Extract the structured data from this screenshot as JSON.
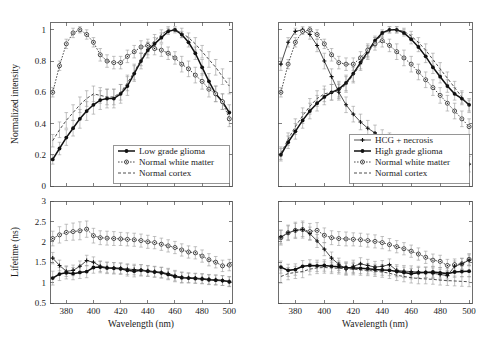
{
  "figure": {
    "title": "",
    "panel_count": 4
  },
  "axes": {
    "wavelength_label": "Wavelength (nm)",
    "intensity_label": "Normalized intensity",
    "lifetime_label": "Lifetime (ns)",
    "wavelength_ticks": [
      "380",
      "400",
      "420",
      "440",
      "460",
      "480",
      "500"
    ],
    "intensity_ticks": [
      "0",
      "0.2",
      "0.4",
      "0.6",
      "0.8",
      "1"
    ],
    "lifetime_ticks": [
      "0.5",
      "1",
      "1.5",
      "2",
      "2.5",
      "3"
    ]
  },
  "legends": {
    "top_left": [
      {
        "label": "Low grade glioma",
        "style": "solid-star"
      },
      {
        "label": "Normal white matter",
        "style": "dotted-circle"
      },
      {
        "label": "Normal cortex",
        "style": "dashed"
      }
    ],
    "top_right": [
      {
        "label": "HCG + necrosis",
        "style": "thin-plus"
      },
      {
        "label": "High grade glioma",
        "style": "solid-star"
      },
      {
        "label": "Normal white matter",
        "style": "dotted-circle"
      },
      {
        "label": "Normal cortex",
        "style": "dashed"
      }
    ]
  },
  "chart_data": [
    {
      "id": "panel-a-intensity-low-grade",
      "type": "line",
      "title": "",
      "xlabel": "",
      "ylabel": "Normalized intensity",
      "xlim": [
        368,
        502
      ],
      "ylim": [
        0,
        1.05
      ],
      "grid": false,
      "legend_position": "bottom-right",
      "x": [
        370,
        375,
        380,
        385,
        390,
        395,
        400,
        405,
        410,
        415,
        420,
        425,
        430,
        435,
        440,
        445,
        450,
        455,
        460,
        465,
        470,
        475,
        480,
        485,
        490,
        495,
        500
      ],
      "series": [
        {
          "name": "Low grade glioma",
          "style": "solid-star",
          "values": [
            0.17,
            0.24,
            0.31,
            0.37,
            0.43,
            0.48,
            0.52,
            0.55,
            0.56,
            0.56,
            0.59,
            0.64,
            0.72,
            0.8,
            0.87,
            0.91,
            0.95,
            0.99,
            1.0,
            0.97,
            0.92,
            0.85,
            0.76,
            0.67,
            0.59,
            0.54,
            0.47
          ],
          "errors": [
            0.03,
            0.04,
            0.05,
            0.05,
            0.06,
            0.06,
            0.06,
            0.06,
            0.06,
            0.06,
            0.06,
            0.06,
            0.05,
            0.05,
            0.05,
            0.04,
            0.03,
            0.02,
            0.01,
            0.02,
            0.03,
            0.04,
            0.05,
            0.05,
            0.05,
            0.05,
            0.05
          ]
        },
        {
          "name": "Normal white matter",
          "style": "dotted-circle",
          "values": [
            0.6,
            0.77,
            0.91,
            0.98,
            1.0,
            0.97,
            0.92,
            0.84,
            0.8,
            0.79,
            0.79,
            0.83,
            0.86,
            0.89,
            0.9,
            0.88,
            0.87,
            0.85,
            0.82,
            0.78,
            0.75,
            0.71,
            0.67,
            0.62,
            0.59,
            0.54,
            0.43
          ],
          "errors": [
            0.03,
            0.03,
            0.03,
            0.03,
            0.02,
            0.03,
            0.03,
            0.04,
            0.04,
            0.04,
            0.04,
            0.04,
            0.04,
            0.04,
            0.04,
            0.04,
            0.04,
            0.04,
            0.04,
            0.05,
            0.05,
            0.05,
            0.05,
            0.05,
            0.05,
            0.05,
            0.05
          ]
        },
        {
          "name": "Normal cortex",
          "style": "dashed",
          "values": [
            0.29,
            0.36,
            0.42,
            0.47,
            0.52,
            0.56,
            0.59,
            0.58,
            0.57,
            0.57,
            0.6,
            0.66,
            0.73,
            0.81,
            0.88,
            0.93,
            0.97,
            1.0,
            1.0,
            0.98,
            0.95,
            0.91,
            0.86,
            0.81,
            0.76,
            0.7,
            0.64
          ],
          "errors": [
            0.04,
            0.05,
            0.05,
            0.05,
            0.05,
            0.05,
            0.05,
            0.05,
            0.05,
            0.05,
            0.05,
            0.05,
            0.05,
            0.04,
            0.04,
            0.04,
            0.03,
            0.02,
            0.02,
            0.03,
            0.03,
            0.04,
            0.04,
            0.05,
            0.05,
            0.05,
            0.05
          ]
        }
      ]
    },
    {
      "id": "panel-b-intensity-high-grade",
      "type": "line",
      "title": "",
      "xlabel": "",
      "ylabel": "",
      "xlim": [
        368,
        502
      ],
      "ylim": [
        0,
        1.05
      ],
      "grid": false,
      "legend_position": "bottom-right",
      "x": [
        370,
        375,
        380,
        385,
        390,
        395,
        400,
        405,
        410,
        415,
        420,
        425,
        430,
        435,
        440,
        445,
        450,
        455,
        460,
        465,
        470,
        475,
        480,
        485,
        490,
        495,
        500
      ],
      "series": [
        {
          "name": "HCG + necrosis",
          "style": "thin-plus",
          "values": [
            0.78,
            0.92,
            0.99,
            1.0,
            0.97,
            0.9,
            0.8,
            0.7,
            0.6,
            0.52,
            0.46,
            0.41,
            0.37,
            0.34,
            0.31,
            0.29,
            0.27,
            0.25,
            0.23,
            0.21,
            0.2,
            0.19,
            0.18,
            0.17,
            0.16,
            0.15,
            0.14
          ],
          "errors": [
            0.04,
            0.03,
            0.02,
            0.02,
            0.03,
            0.04,
            0.05,
            0.05,
            0.05,
            0.05,
            0.05,
            0.05,
            0.05,
            0.05,
            0.05,
            0.05,
            0.05,
            0.05,
            0.05,
            0.05,
            0.05,
            0.05,
            0.05,
            0.05,
            0.05,
            0.05,
            0.05
          ]
        },
        {
          "name": "High grade glioma",
          "style": "solid-star",
          "values": [
            0.2,
            0.28,
            0.35,
            0.42,
            0.48,
            0.53,
            0.57,
            0.6,
            0.62,
            0.66,
            0.72,
            0.79,
            0.86,
            0.93,
            0.98,
            1.0,
            1.0,
            0.98,
            0.94,
            0.89,
            0.83,
            0.76,
            0.7,
            0.64,
            0.59,
            0.56,
            0.52
          ],
          "errors": [
            0.04,
            0.04,
            0.05,
            0.05,
            0.05,
            0.05,
            0.05,
            0.05,
            0.05,
            0.05,
            0.05,
            0.04,
            0.04,
            0.03,
            0.02,
            0.02,
            0.02,
            0.02,
            0.03,
            0.03,
            0.04,
            0.04,
            0.04,
            0.04,
            0.04,
            0.04,
            0.04
          ]
        },
        {
          "name": "Normal white matter",
          "style": "dotted-circle",
          "values": [
            0.6,
            0.78,
            0.92,
            0.99,
            1.0,
            0.97,
            0.91,
            0.84,
            0.79,
            0.78,
            0.78,
            0.82,
            0.87,
            0.91,
            0.93,
            0.9,
            0.86,
            0.82,
            0.78,
            0.73,
            0.68,
            0.63,
            0.58,
            0.53,
            0.48,
            0.43,
            0.38
          ],
          "errors": [
            0.03,
            0.03,
            0.03,
            0.02,
            0.02,
            0.03,
            0.03,
            0.04,
            0.04,
            0.04,
            0.04,
            0.04,
            0.04,
            0.04,
            0.04,
            0.04,
            0.05,
            0.05,
            0.05,
            0.05,
            0.05,
            0.05,
            0.05,
            0.05,
            0.05,
            0.05,
            0.05
          ]
        },
        {
          "name": "Normal cortex",
          "style": "dashed",
          "values": [
            0.21,
            0.3,
            0.38,
            0.45,
            0.51,
            0.56,
            0.59,
            0.6,
            0.61,
            0.65,
            0.71,
            0.78,
            0.85,
            0.92,
            0.97,
            1.0,
            1.0,
            0.99,
            0.96,
            0.92,
            0.87,
            0.81,
            0.75,
            0.69,
            0.63,
            0.57,
            0.51
          ],
          "errors": [
            0.04,
            0.04,
            0.05,
            0.05,
            0.05,
            0.05,
            0.05,
            0.05,
            0.05,
            0.05,
            0.05,
            0.04,
            0.04,
            0.03,
            0.02,
            0.02,
            0.02,
            0.02,
            0.03,
            0.03,
            0.04,
            0.04,
            0.04,
            0.04,
            0.04,
            0.04,
            0.04
          ]
        }
      ]
    },
    {
      "id": "panel-c-lifetime-low-grade",
      "type": "line",
      "title": "",
      "xlabel": "Wavelength (nm)",
      "ylabel": "Lifetime (ns)",
      "xlim": [
        368,
        502
      ],
      "ylim": [
        0.5,
        3.0
      ],
      "grid": false,
      "legend_position": "none",
      "x": [
        370,
        375,
        380,
        385,
        390,
        395,
        400,
        405,
        410,
        415,
        420,
        425,
        430,
        435,
        440,
        445,
        450,
        455,
        460,
        465,
        470,
        475,
        480,
        485,
        490,
        495,
        500
      ],
      "series": [
        {
          "name": "Normal white matter",
          "style": "dotted-circle",
          "values": [
            2.08,
            2.17,
            2.23,
            2.25,
            2.27,
            2.31,
            2.15,
            2.1,
            2.09,
            2.08,
            2.07,
            2.06,
            2.05,
            2.03,
            2.0,
            1.98,
            1.94,
            1.9,
            1.86,
            1.8,
            1.75,
            1.73,
            1.65,
            1.56,
            1.5,
            1.41,
            1.43
          ],
          "errors": [
            0.18,
            0.2,
            0.2,
            0.21,
            0.22,
            0.2,
            0.18,
            0.17,
            0.17,
            0.17,
            0.16,
            0.16,
            0.16,
            0.16,
            0.16,
            0.15,
            0.15,
            0.15,
            0.15,
            0.15,
            0.15,
            0.15,
            0.15,
            0.15,
            0.14,
            0.14,
            0.14
          ]
        },
        {
          "name": "Low grade glioma",
          "style": "solid-star",
          "values": [
            1.11,
            1.21,
            1.24,
            1.22,
            1.25,
            1.27,
            1.37,
            1.38,
            1.36,
            1.35,
            1.34,
            1.3,
            1.28,
            1.3,
            1.28,
            1.26,
            1.24,
            1.2,
            1.15,
            1.12,
            1.11,
            1.1,
            1.09,
            1.07,
            1.06,
            1.05,
            1.02
          ],
          "errors": [
            0.17,
            0.16,
            0.15,
            0.15,
            0.15,
            0.15,
            0.14,
            0.14,
            0.14,
            0.14,
            0.14,
            0.14,
            0.14,
            0.14,
            0.13,
            0.13,
            0.13,
            0.13,
            0.13,
            0.13,
            0.12,
            0.12,
            0.12,
            0.12,
            0.12,
            0.12,
            0.12
          ]
        },
        {
          "name": "Normal cortex",
          "style": "thin-plus",
          "values": [
            1.6,
            1.42,
            1.28,
            1.3,
            1.4,
            1.54,
            1.5,
            1.4,
            1.37,
            1.36,
            1.35,
            1.33,
            1.32,
            1.31,
            1.29,
            1.27,
            1.25,
            1.22,
            1.17,
            1.13,
            1.12,
            1.11,
            1.1,
            1.08,
            1.07,
            1.05,
            1.03
          ],
          "errors": [
            0.14,
            0.13,
            0.13,
            0.13,
            0.13,
            0.13,
            0.13,
            0.13,
            0.13,
            0.13,
            0.13,
            0.13,
            0.13,
            0.13,
            0.13,
            0.13,
            0.13,
            0.13,
            0.13,
            0.13,
            0.12,
            0.12,
            0.12,
            0.12,
            0.12,
            0.12,
            0.12
          ]
        }
      ]
    },
    {
      "id": "panel-d-lifetime-high-grade",
      "type": "line",
      "title": "",
      "xlabel": "Wavelength (nm)",
      "ylabel": "",
      "xlim": [
        368,
        502
      ],
      "ylim": [
        0.5,
        3.0
      ],
      "grid": false,
      "legend_position": "none",
      "x": [
        370,
        375,
        380,
        385,
        390,
        395,
        400,
        405,
        410,
        415,
        420,
        425,
        430,
        435,
        440,
        445,
        450,
        455,
        460,
        465,
        470,
        475,
        480,
        485,
        490,
        495,
        500
      ],
      "series": [
        {
          "name": "Normal white matter",
          "style": "dotted-circle",
          "values": [
            2.1,
            2.22,
            2.28,
            2.3,
            2.25,
            2.28,
            2.16,
            2.1,
            2.08,
            2.07,
            2.06,
            2.05,
            2.03,
            2.01,
            1.98,
            1.93,
            1.88,
            1.83,
            1.77,
            1.7,
            1.62,
            1.55,
            1.52,
            1.42,
            1.44,
            1.46,
            1.57
          ],
          "errors": [
            0.18,
            0.19,
            0.2,
            0.21,
            0.2,
            0.19,
            0.18,
            0.17,
            0.17,
            0.17,
            0.16,
            0.16,
            0.16,
            0.16,
            0.15,
            0.15,
            0.15,
            0.15,
            0.15,
            0.15,
            0.15,
            0.15,
            0.15,
            0.15,
            0.14,
            0.14,
            0.14
          ]
        },
        {
          "name": "HCG + necrosis",
          "style": "thin-plus",
          "values": [
            2.12,
            2.22,
            2.28,
            2.3,
            2.2,
            2.02,
            1.82,
            1.6,
            1.45,
            1.33,
            1.4,
            1.46,
            1.42,
            1.38,
            1.4,
            1.44,
            1.3,
            1.28,
            1.27,
            1.26,
            1.25,
            1.23,
            1.2,
            1.17,
            1.4,
            1.46,
            1.55
          ],
          "errors": [
            0.17,
            0.17,
            0.17,
            0.17,
            0.16,
            0.16,
            0.16,
            0.15,
            0.15,
            0.15,
            0.15,
            0.15,
            0.15,
            0.14,
            0.14,
            0.14,
            0.14,
            0.14,
            0.14,
            0.14,
            0.13,
            0.13,
            0.13,
            0.13,
            0.13,
            0.13,
            0.13
          ]
        },
        {
          "name": "High grade glioma",
          "style": "solid-star",
          "values": [
            1.38,
            1.3,
            1.32,
            1.4,
            1.42,
            1.41,
            1.42,
            1.4,
            1.39,
            1.37,
            1.36,
            1.35,
            1.34,
            1.32,
            1.31,
            1.3,
            1.27,
            1.25,
            1.22,
            1.24,
            1.25,
            1.26,
            1.24,
            1.22,
            1.26,
            1.27,
            1.28
          ],
          "errors": [
            0.15,
            0.15,
            0.14,
            0.14,
            0.14,
            0.14,
            0.14,
            0.14,
            0.14,
            0.14,
            0.14,
            0.13,
            0.13,
            0.13,
            0.13,
            0.13,
            0.13,
            0.13,
            0.13,
            0.13,
            0.13,
            0.13,
            0.13,
            0.13,
            0.13,
            0.13,
            0.13
          ]
        },
        {
          "name": "Normal cortex",
          "style": "dashed",
          "values": [
            1.15,
            1.22,
            1.25,
            1.27,
            1.33,
            1.36,
            1.37,
            1.36,
            1.35,
            1.34,
            1.33,
            1.31,
            1.3,
            1.28,
            1.26,
            1.23,
            1.18,
            1.15,
            1.12,
            1.1,
            1.09,
            1.08,
            1.06,
            1.05,
            1.04,
            1.03,
            1.02
          ],
          "errors": [
            0.16,
            0.15,
            0.15,
            0.15,
            0.14,
            0.14,
            0.14,
            0.14,
            0.14,
            0.14,
            0.14,
            0.13,
            0.13,
            0.13,
            0.13,
            0.13,
            0.13,
            0.13,
            0.13,
            0.13,
            0.12,
            0.12,
            0.12,
            0.12,
            0.12,
            0.12,
            0.12
          ]
        }
      ]
    }
  ]
}
